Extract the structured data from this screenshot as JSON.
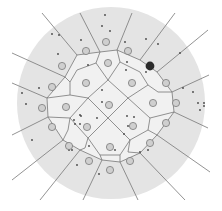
{
  "diagram": {
    "type": "voronoi-tessellation",
    "colors": {
      "background": "#ffffff",
      "disc": "#e4e4e4",
      "cells": "#f1f1f1",
      "edges": "#777777",
      "site_fill": "#cfcfcf",
      "site_stroke": "#7a7a7a",
      "highlight_site": "#2b2b2b",
      "dots": "#444444"
    },
    "disc": {
      "cx": 111,
      "cy": 103,
      "rx": 94,
      "ry": 96
    },
    "ring_sites": [
      [
        106,
        42
      ],
      [
        128,
        51
      ],
      [
        86,
        51
      ],
      [
        62,
        66
      ],
      [
        166,
        83
      ],
      [
        52,
        87
      ],
      [
        176,
        103
      ],
      [
        42,
        108
      ],
      [
        166,
        123
      ],
      [
        52,
        127
      ],
      [
        150,
        143
      ],
      [
        69,
        146
      ],
      [
        89,
        161
      ],
      [
        130,
        161
      ],
      [
        110,
        170
      ]
    ],
    "inner_sites": [
      [
        108,
        63
      ],
      [
        86,
        83
      ],
      [
        132,
        83
      ],
      [
        153,
        103
      ],
      [
        66,
        107
      ],
      [
        109,
        105
      ],
      [
        87,
        127
      ],
      [
        133,
        126
      ],
      [
        110,
        147
      ]
    ],
    "highlight_site": [
      150,
      66
    ],
    "inner_polygon": [
      [
        100,
        52
      ],
      [
        117,
        50
      ],
      [
        140,
        60
      ],
      [
        157,
        72
      ],
      [
        172,
        92
      ],
      [
        174,
        112
      ],
      [
        157,
        135
      ],
      [
        140,
        153
      ],
      [
        120,
        162
      ],
      [
        102,
        160
      ],
      [
        80,
        150
      ],
      [
        63,
        140
      ],
      [
        48,
        117
      ],
      [
        47,
        98
      ],
      [
        65,
        77
      ],
      [
        77,
        55
      ]
    ],
    "inner_edges": [
      [
        [
          100,
          52
        ],
        [
          96,
          63
        ]
      ],
      [
        [
          117,
          50
        ],
        [
          120,
          62
        ]
      ],
      [
        [
          96,
          63
        ],
        [
          77,
          70
        ]
      ],
      [
        [
          120,
          62
        ],
        [
          140,
          72
        ]
      ],
      [
        [
          96,
          63
        ],
        [
          108,
          80
        ]
      ],
      [
        [
          120,
          62
        ],
        [
          108,
          80
        ]
      ],
      [
        [
          77,
          70
        ],
        [
          70,
          82
        ]
      ],
      [
        [
          140,
          72
        ],
        [
          148,
          85
        ]
      ],
      [
        [
          70,
          82
        ],
        [
          70,
          95
        ]
      ],
      [
        [
          148,
          85
        ],
        [
          158,
          92
        ]
      ],
      [
        [
          70,
          82
        ],
        [
          65,
          77
        ]
      ],
      [
        [
          158,
          92
        ],
        [
          172,
          92
        ]
      ],
      [
        [
          108,
          80
        ],
        [
          88,
          98
        ]
      ],
      [
        [
          108,
          80
        ],
        [
          128,
          98
        ]
      ],
      [
        [
          70,
          95
        ],
        [
          47,
          98
        ]
      ],
      [
        [
          70,
          95
        ],
        [
          88,
          98
        ]
      ],
      [
        [
          128,
          98
        ],
        [
          148,
          85
        ]
      ],
      [
        [
          128,
          98
        ],
        [
          108,
          118
        ]
      ],
      [
        [
          88,
          98
        ],
        [
          108,
          118
        ]
      ],
      [
        [
          128,
          98
        ],
        [
          150,
          118
        ]
      ],
      [
        [
          150,
          118
        ],
        [
          174,
          112
        ]
      ],
      [
        [
          150,
          118
        ],
        [
          148,
          130
        ]
      ],
      [
        [
          148,
          130
        ],
        [
          157,
          135
        ]
      ],
      [
        [
          148,
          130
        ],
        [
          130,
          140
        ]
      ],
      [
        [
          108,
          118
        ],
        [
          88,
          138
        ]
      ],
      [
        [
          108,
          118
        ],
        [
          130,
          140
        ]
      ],
      [
        [
          70,
          118
        ],
        [
          48,
          117
        ]
      ],
      [
        [
          70,
          118
        ],
        [
          88,
          138
        ]
      ],
      [
        [
          70,
          118
        ],
        [
          88,
          98
        ]
      ],
      [
        [
          70,
          118
        ],
        [
          68,
          130
        ]
      ],
      [
        [
          68,
          130
        ],
        [
          63,
          140
        ]
      ],
      [
        [
          88,
          138
        ],
        [
          85,
          148
        ]
      ],
      [
        [
          85,
          148
        ],
        [
          80,
          150
        ]
      ],
      [
        [
          130,
          140
        ],
        [
          128,
          152
        ]
      ],
      [
        [
          128,
          152
        ],
        [
          140,
          153
        ]
      ],
      [
        [
          88,
          138
        ],
        [
          100,
          155
        ]
      ],
      [
        [
          130,
          140
        ],
        [
          120,
          155
        ]
      ],
      [
        [
          100,
          155
        ],
        [
          120,
          155
        ]
      ],
      [
        [
          100,
          155
        ],
        [
          102,
          160
        ]
      ],
      [
        [
          120,
          155
        ],
        [
          120,
          162
        ]
      ]
    ],
    "rays": [
      [
        [
          77,
          55
        ],
        [
          42,
          13
        ]
      ],
      [
        [
          100,
          52
        ],
        [
          80,
          13
        ]
      ],
      [
        [
          117,
          50
        ],
        [
          132,
          13
        ]
      ],
      [
        [
          140,
          60
        ],
        [
          175,
          13
        ]
      ],
      [
        [
          157,
          72
        ],
        [
          208,
          30
        ]
      ],
      [
        [
          172,
          92
        ],
        [
          209,
          75
        ]
      ],
      [
        [
          174,
          112
        ],
        [
          208,
          128
        ]
      ],
      [
        [
          157,
          135
        ],
        [
          210,
          172
        ]
      ],
      [
        [
          140,
          153
        ],
        [
          185,
          200
        ]
      ],
      [
        [
          120,
          162
        ],
        [
          138,
          200
        ]
      ],
      [
        [
          102,
          160
        ],
        [
          83,
          200
        ]
      ],
      [
        [
          80,
          150
        ],
        [
          40,
          200
        ]
      ],
      [
        [
          63,
          140
        ],
        [
          12,
          180
        ]
      ],
      [
        [
          48,
          117
        ],
        [
          12,
          135
        ]
      ],
      [
        [
          47,
          98
        ],
        [
          12,
          83
        ]
      ],
      [
        [
          65,
          77
        ],
        [
          12,
          53
        ]
      ]
    ],
    "dots": [
      [
        105,
        15
      ],
      [
        102,
        26
      ],
      [
        110,
        31
      ],
      [
        52,
        34
      ],
      [
        59,
        35
      ],
      [
        81,
        40
      ],
      [
        125,
        42
      ],
      [
        146,
        39
      ],
      [
        158,
        44
      ],
      [
        180,
        53
      ],
      [
        58,
        54
      ],
      [
        88,
        65
      ],
      [
        127,
        62
      ],
      [
        126,
        70
      ],
      [
        146,
        72
      ],
      [
        39,
        88
      ],
      [
        22,
        93
      ],
      [
        26,
        104
      ],
      [
        102,
        90
      ],
      [
        102,
        102
      ],
      [
        183,
        88
      ],
      [
        193,
        92
      ],
      [
        198,
        103
      ],
      [
        204,
        103
      ],
      [
        204,
        106
      ],
      [
        200,
        110
      ],
      [
        80,
        115
      ],
      [
        74,
        120
      ],
      [
        75,
        124
      ],
      [
        80,
        124
      ],
      [
        81,
        116
      ],
      [
        97,
        118
      ],
      [
        127,
        116
      ],
      [
        134,
        117
      ],
      [
        128,
        126
      ],
      [
        124,
        134
      ],
      [
        89,
        146
      ],
      [
        72,
        150
      ],
      [
        115,
        150
      ],
      [
        32,
        140
      ],
      [
        77,
        165
      ],
      [
        99,
        174
      ],
      [
        140,
        152
      ],
      [
        69,
        150
      ],
      [
        112,
        148
      ],
      [
        148,
        150
      ]
    ]
  }
}
